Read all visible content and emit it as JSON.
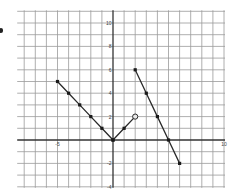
{
  "chart_data": {
    "type": "line",
    "title": "",
    "xlabel": "",
    "ylabel": "",
    "xlim": [
      -8,
      10
    ],
    "ylim": [
      -4,
      11
    ],
    "grid": true,
    "x_tick_labels": [
      {
        "value": -5,
        "label": "-5"
      },
      {
        "value": 10,
        "label": "10"
      }
    ],
    "y_tick_labels": [
      {
        "value": 10,
        "label": "10"
      },
      {
        "value": 8,
        "label": "8"
      },
      {
        "value": 6,
        "label": "6"
      },
      {
        "value": 4,
        "label": "4"
      },
      {
        "value": 2,
        "label": "2"
      },
      {
        "value": -2,
        "label": "-2"
      },
      {
        "value": -4,
        "label": "-4"
      }
    ],
    "series": [
      {
        "name": "segment-1",
        "points": [
          [
            -5,
            5
          ],
          [
            -4,
            4
          ],
          [
            -3,
            3
          ],
          [
            -2,
            2
          ],
          [
            -1,
            1
          ],
          [
            0,
            0
          ]
        ],
        "markers": "filled"
      },
      {
        "name": "segment-2",
        "points": [
          [
            0,
            0
          ],
          [
            1,
            1
          ],
          [
            2,
            2
          ]
        ],
        "markers": "filled",
        "end_marker": "open"
      },
      {
        "name": "segment-3",
        "points": [
          [
            2,
            6
          ],
          [
            3,
            4
          ],
          [
            4,
            2
          ],
          [
            5,
            0
          ],
          [
            6,
            -2
          ]
        ],
        "markers": "filled"
      }
    ]
  },
  "colors": {
    "grid": "#9a9a9a",
    "axis": "#333333",
    "line": "#2a2a2a",
    "marker": "#1a1a1a",
    "open_marker_fill": "#e8e8e8"
  }
}
